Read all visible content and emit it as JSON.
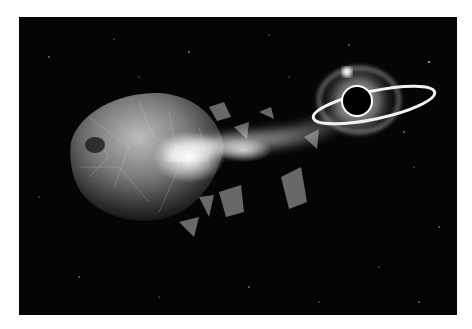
{
  "image": {
    "alt": "Shattered planet being torn apart and pulled toward a black hole with a glowing accretion ring",
    "background_color": "#ffffff",
    "frame_color": "#050505",
    "subjects": [
      "shattered-planet",
      "debris-stream",
      "black-hole",
      "accretion-ring",
      "stars"
    ]
  }
}
